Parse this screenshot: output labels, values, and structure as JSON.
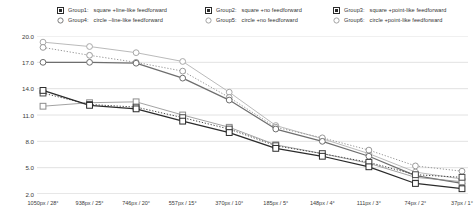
{
  "legend": {
    "rows": [
      [
        {
          "name": "Group1:",
          "desc": "square +line-like feedforward",
          "marker": "square-filled-marker",
          "style": "solid"
        },
        {
          "name": "Group2:",
          "desc": "square +no feedforward",
          "marker": "square-filled-marker",
          "style": "thin"
        },
        {
          "name": "Group3:",
          "desc": "square +point-like feedforward",
          "marker": "square-filled-marker",
          "style": "dotted"
        }
      ],
      [
        {
          "name": "Group4:",
          "desc": "circle –line-like feedforward",
          "marker": "circle-open-marker",
          "style": "solid"
        },
        {
          "name": "Group5:",
          "desc": "circle +no feedforward",
          "marker": "circle-open-marker",
          "style": "thin"
        },
        {
          "name": "Group6:",
          "desc": "circle +point-like feedforward",
          "marker": "circle-open-marker",
          "style": "dotted"
        }
      ]
    ]
  },
  "chart_data": {
    "type": "line",
    "title": "",
    "xlabel": "",
    "ylabel": "",
    "ylim": [
      2.0,
      20.0
    ],
    "yticks": [
      "20.0",
      "17.0",
      "14.0",
      "11.0",
      "8.0",
      "5.0",
      "2.0"
    ],
    "ytick_values": [
      20.0,
      17.0,
      14.0,
      11.0,
      8.0,
      5.0,
      2.0
    ],
    "grid": true,
    "legend_position": "top",
    "categories": [
      "1050px / 28°",
      "938px / 25°",
      "746px / 20°",
      "557px / 15°",
      "370px / 10°",
      "185px / 5°",
      "148px / 4°",
      "111px / 3°",
      "74px / 2°",
      "37px / 1°"
    ],
    "series": [
      {
        "name": "Group1",
        "label": "Group1: square +line-like feedforward",
        "marker": "square",
        "line_style": "solid",
        "color": "#2b2b2b",
        "values": [
          13.8,
          12.1,
          11.7,
          10.3,
          9.0,
          7.2,
          6.3,
          5.1,
          3.2,
          2.6
        ]
      },
      {
        "name": "Group2",
        "label": "Group2: square +no feedforward",
        "marker": "square",
        "line_style": "thin",
        "color": "#8c8c8c",
        "values": [
          12.0,
          12.4,
          12.5,
          11.0,
          9.6,
          7.6,
          6.6,
          5.5,
          3.9,
          3.4
        ]
      },
      {
        "name": "Group3",
        "label": "Group3: square +point-like feedforward",
        "marker": "square",
        "line_style": "dotted",
        "color": "#4a4a4a",
        "values": [
          13.5,
          12.2,
          11.9,
          10.7,
          9.4,
          7.5,
          6.6,
          5.6,
          4.2,
          3.9
        ]
      },
      {
        "name": "Group4",
        "label": "Group4: circle –line-like feedforward",
        "marker": "circle",
        "line_style": "solid",
        "color": "#6e6e6e",
        "values": [
          17.0,
          17.0,
          16.9,
          15.2,
          12.7,
          9.4,
          8.0,
          6.3,
          4.1,
          3.2
        ]
      },
      {
        "name": "Group5",
        "label": "Group5: circle +no feedforward",
        "marker": "circle",
        "line_style": "thin",
        "color": "#a8a8a8",
        "values": [
          19.3,
          18.8,
          18.1,
          17.1,
          13.6,
          9.8,
          8.3,
          6.6,
          4.5,
          3.7
        ]
      },
      {
        "name": "Group6",
        "label": "Group6: circle +point-like feedforward",
        "marker": "circle",
        "line_style": "dotted",
        "color": "#9a9a9a",
        "values": [
          18.7,
          17.8,
          17.0,
          16.0,
          13.0,
          9.6,
          8.4,
          7.0,
          5.2,
          4.6
        ]
      }
    ]
  }
}
